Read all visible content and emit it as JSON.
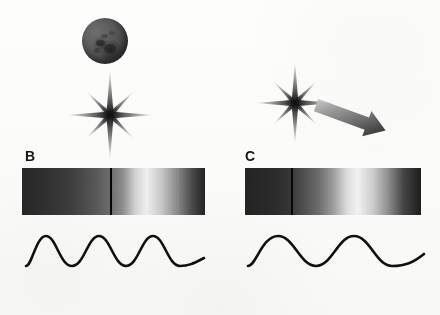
{
  "figure": {
    "background_color": "#fcfcfb",
    "width": 440,
    "height": 315
  },
  "panels": [
    {
      "id": "B",
      "label": "B",
      "label_x": 25,
      "label_y": 149,
      "description": "Stationary source: star with orbiting body, unshifted spectrum",
      "source": {
        "sphere": {
          "name": "planet-sphere",
          "x": 82,
          "y": 18,
          "diameter": 46,
          "fill_color": "#4c4c4c",
          "visible": true
        },
        "star": {
          "name": "star-burst",
          "center_x": 110,
          "center_y": 115,
          "ray_length_long": 42,
          "ray_length_short": 18,
          "color": "#1d1d1d"
        },
        "motion_arrow": {
          "visible": false
        }
      },
      "spectrum": {
        "name": "spectrum-bar-b",
        "x": 22,
        "y": 168,
        "width": 183,
        "height": 47,
        "bright_peak_position_pct": 62,
        "dark_left_color": "#2b2b2b",
        "bright_color": "#f2f2f2",
        "dark_right_color": "#262626",
        "absorption_line": {
          "name": "absorption-line-b",
          "position_pct": 48,
          "color": "#050505",
          "width_px": 2
        }
      },
      "wave": {
        "name": "wave-b",
        "x": 24,
        "y": 228,
        "width": 182,
        "height": 46,
        "cycles": 3,
        "amplitude": 15,
        "stroke_color": "#101010",
        "stroke_width": 2.6,
        "wavelength_label": "short wavelength"
      }
    },
    {
      "id": "C",
      "label": "C",
      "label_x": 245,
      "label_y": 149,
      "description": "Receding source: star moving away, redshifted spectrum",
      "source": {
        "sphere": {
          "visible": false
        },
        "star": {
          "name": "star-burst",
          "center_x": 295,
          "center_y": 103,
          "ray_length_long": 38,
          "ray_length_short": 16,
          "color": "#1d1d1d"
        },
        "motion_arrow": {
          "name": "motion-arrow",
          "visible": true,
          "start_x": 318,
          "start_y": 104,
          "end_x": 389,
          "end_y": 130,
          "gradient_from": "#cdcdcd",
          "gradient_to": "#4a4a4a",
          "direction": "down-right"
        }
      },
      "spectrum": {
        "name": "spectrum-bar-c",
        "x": 245,
        "y": 168,
        "width": 176,
        "height": 47,
        "bright_peak_position_pct": 58,
        "dark_left_color": "#2b2b2b",
        "bright_color": "#f4f4f4",
        "dark_right_color": "#1f1f1f",
        "absorption_line": {
          "name": "absorption-line-c",
          "position_pct": 26,
          "color": "#050505",
          "width_px": 2
        }
      },
      "wave": {
        "name": "wave-c",
        "x": 246,
        "y": 228,
        "width": 180,
        "height": 46,
        "cycles": 2,
        "amplitude": 15,
        "stroke_color": "#101010",
        "stroke_width": 2.6,
        "wavelength_label": "long wavelength"
      }
    }
  ]
}
